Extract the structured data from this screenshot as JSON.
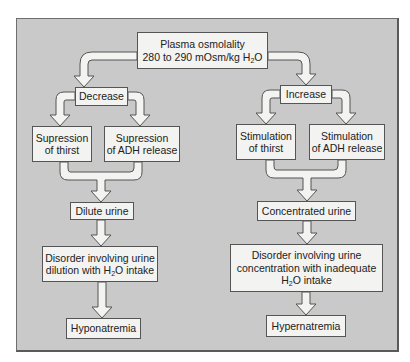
{
  "diagram": {
    "root": {
      "line1": "Plasma osmolality",
      "line2_prefix": "280 to 290 mOsm/kg H",
      "line2_sub": "2",
      "line2_suffix": "O"
    },
    "left_branch": {
      "label": "Decrease",
      "thirst": {
        "line1": "Supression",
        "line2": "of thirst"
      },
      "adh": {
        "line1": "Supression",
        "line2": "of ADH release"
      },
      "urine": "Dilute urine",
      "disorder": {
        "line1": "Disorder involving urine",
        "line2_prefix": "dilution with H",
        "line2_sub": "2",
        "line2_suffix": "O intake"
      },
      "result": "Hyponatremia"
    },
    "right_branch": {
      "label": "Increase",
      "thirst": {
        "line1": "Stimulation",
        "line2": "of thirst"
      },
      "adh": {
        "line1": "Stimulation",
        "line2": "of ADH release"
      },
      "urine": "Concentrated urine",
      "disorder": {
        "line1": "Disorder involving urine",
        "line2": "concentration with inadequate",
        "line3_prefix": "H",
        "line3_sub": "2",
        "line3_suffix": "O intake"
      },
      "result": "Hypernatremia"
    },
    "colors": {
      "panel": "#c9c9c9",
      "box": "#f3f3f1",
      "arrow_fill": "#f3f3f1",
      "outline": "#555555"
    }
  }
}
